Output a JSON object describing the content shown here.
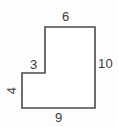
{
  "figure": {
    "kind": "geometry-diagram",
    "shape_name": "l-shaped-hexagon",
    "stroke_color": "#4a4a4a",
    "fill_color": "#ffffff",
    "background_color": "#fdfdfd",
    "label_color": "#3a3a3a",
    "stroke_width": 1.6,
    "viewbox": "0 0 118 127",
    "outline_points": "45,27 95,27 95,108 22,108 22,73 45,73",
    "vertices": [
      {
        "name": "top-left-of-upper-arm",
        "x": 45,
        "y": 27
      },
      {
        "name": "top-right",
        "x": 95,
        "y": 27
      },
      {
        "name": "bottom-right",
        "x": 95,
        "y": 108
      },
      {
        "name": "bottom-left",
        "x": 22,
        "y": 108
      },
      {
        "name": "notch-left",
        "x": 22,
        "y": 73
      },
      {
        "name": "notch-inner-corner",
        "x": 45,
        "y": 73
      }
    ],
    "labels": {
      "top": "6",
      "right": "10",
      "bottom": "9",
      "notch": "3",
      "left": "4"
    },
    "edges": [
      {
        "name": "top-edge",
        "label": "6",
        "orientation": "horizontal",
        "length": 6
      },
      {
        "name": "right-edge",
        "label": "10",
        "orientation": "vertical",
        "length": 10
      },
      {
        "name": "bottom-edge",
        "label": "9",
        "orientation": "horizontal",
        "length": 9
      },
      {
        "name": "left-lower-edge",
        "label": "4",
        "orientation": "vertical",
        "length": 4
      },
      {
        "name": "notch-top-edge",
        "label": "3",
        "orientation": "horizontal",
        "length": 3
      },
      {
        "name": "notch-right-edge",
        "label": "",
        "orientation": "vertical",
        "length": 6
      }
    ]
  }
}
